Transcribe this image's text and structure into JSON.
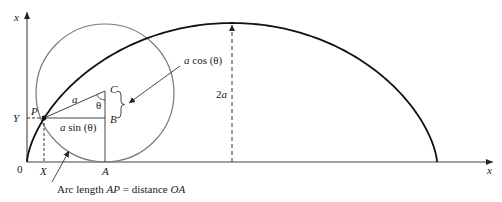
{
  "diagram": {
    "axes": {
      "vertical_label": "x",
      "horizontal_label": "x",
      "origin_label": "0"
    },
    "points": {
      "P": "P",
      "C": "C",
      "B": "B",
      "A": "A",
      "X": "X",
      "Y": "Y"
    },
    "labels": {
      "radius": "a",
      "angle": "θ",
      "a_sin_prefix": "a",
      "a_sin_suffix": " sin (θ)",
      "a_cos_prefix": "a",
      "a_cos_suffix": " cos (θ)",
      "height_prefix": "2",
      "height_var": "a"
    },
    "caption": {
      "part1": "Arc length ",
      "ap": "AP",
      "part2": " = distance ",
      "oa": "OA"
    },
    "colors": {
      "cycloid": "#111111",
      "circle": "#777777",
      "lines": "#333333",
      "text": "#1a1a1a"
    }
  }
}
